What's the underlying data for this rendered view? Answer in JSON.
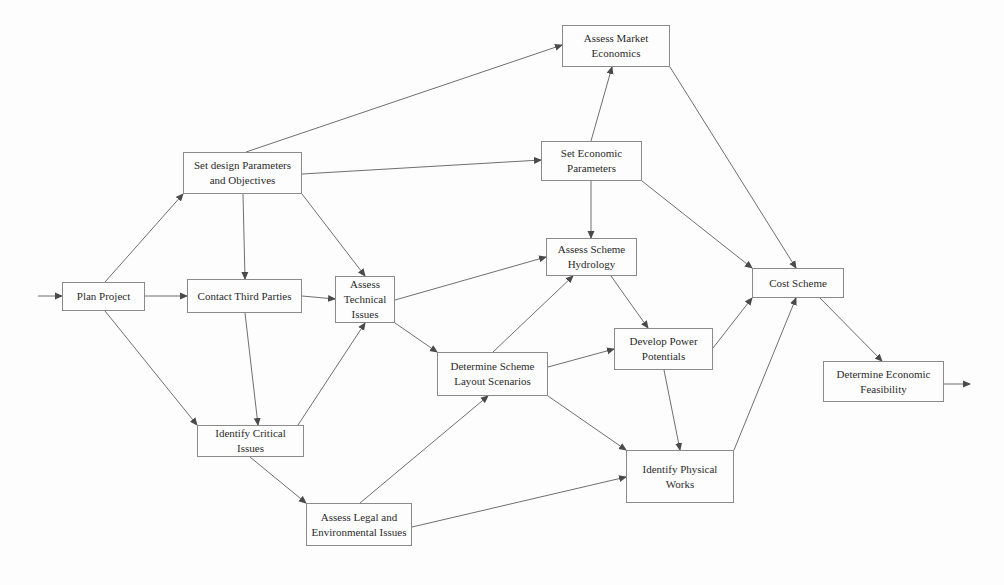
{
  "diagram": {
    "type": "process flow network",
    "nodes": [
      {
        "id": "plan_project",
        "label": "Plan Project",
        "x": 62,
        "y": 282,
        "w": 83,
        "h": 29
      },
      {
        "id": "contact_third_parties",
        "label": "Contact Third Parties",
        "x": 187,
        "y": 279,
        "w": 115,
        "h": 34
      },
      {
        "id": "set_design_parameters",
        "label": "Set design Parameters and Objectives",
        "x": 183,
        "y": 152,
        "w": 119,
        "h": 42
      },
      {
        "id": "assess_market_economics",
        "label": "Assess Market Economics",
        "x": 562,
        "y": 25,
        "w": 108,
        "h": 42
      },
      {
        "id": "set_economic_parameters",
        "label": "Set Economic Parameters",
        "x": 541,
        "y": 141,
        "w": 101,
        "h": 40
      },
      {
        "id": "assess_technical_issues",
        "label": "Assess Technical Issues",
        "x": 335,
        "y": 276,
        "w": 60,
        "h": 47
      },
      {
        "id": "assess_scheme_hydrology",
        "label": "Assess Scheme Hydrology",
        "x": 546,
        "y": 238,
        "w": 91,
        "h": 38
      },
      {
        "id": "determine_layout_scenarios",
        "label": "Determine Scheme Layout Scenarios",
        "x": 437,
        "y": 352,
        "w": 111,
        "h": 44
      },
      {
        "id": "develop_power_potentials",
        "label": "Develop Power Potentials",
        "x": 614,
        "y": 328,
        "w": 99,
        "h": 42
      },
      {
        "id": "cost_scheme",
        "label": "Cost Scheme",
        "x": 752,
        "y": 268,
        "w": 92,
        "h": 30
      },
      {
        "id": "determine_economic_feasibility",
        "label": "Determine Economic Feasibility",
        "x": 823,
        "y": 361,
        "w": 121,
        "h": 41
      },
      {
        "id": "identify_critical_issues",
        "label": "Identify Critical Issues",
        "x": 197,
        "y": 425,
        "w": 107,
        "h": 32
      },
      {
        "id": "identify_physical_works",
        "label": "Identify Physical Works",
        "x": 626,
        "y": 450,
        "w": 108,
        "h": 53
      },
      {
        "id": "assess_legal_environmental",
        "label": "Assess Legal and Environmental Issues",
        "x": 306,
        "y": 503,
        "w": 106,
        "h": 43
      }
    ],
    "edges": [
      {
        "from": "entry",
        "to": "plan_project",
        "x1": 38,
        "y1": 296,
        "x2": 62,
        "y2": 296
      },
      {
        "from": "plan_project",
        "to": "set_design_parameters",
        "x1": 105,
        "y1": 282,
        "x2": 183,
        "y2": 194
      },
      {
        "from": "plan_project",
        "to": "contact_third_parties",
        "x1": 145,
        "y1": 296,
        "x2": 187,
        "y2": 296
      },
      {
        "from": "plan_project",
        "to": "identify_critical_issues",
        "x1": 105,
        "y1": 311,
        "x2": 197,
        "y2": 425
      },
      {
        "from": "set_design_parameters",
        "to": "assess_market_economics",
        "x1": 246,
        "y1": 152,
        "x2": 562,
        "y2": 45
      },
      {
        "from": "set_design_parameters",
        "to": "set_economic_parameters",
        "x1": 302,
        "y1": 174,
        "x2": 541,
        "y2": 160
      },
      {
        "from": "set_design_parameters",
        "to": "contact_third_parties",
        "x1": 243,
        "y1": 194,
        "x2": 245,
        "y2": 279
      },
      {
        "from": "set_design_parameters",
        "to": "assess_technical_issues",
        "x1": 302,
        "y1": 194,
        "x2": 365,
        "y2": 276
      },
      {
        "from": "contact_third_parties",
        "to": "assess_technical_issues",
        "x1": 302,
        "y1": 296,
        "x2": 335,
        "y2": 299
      },
      {
        "from": "contact_third_parties",
        "to": "identify_critical_issues",
        "x1": 245,
        "y1": 313,
        "x2": 258,
        "y2": 425
      },
      {
        "from": "identify_critical_issues",
        "to": "assess_technical_issues",
        "x1": 298,
        "y1": 425,
        "x2": 365,
        "y2": 323
      },
      {
        "from": "identify_critical_issues",
        "to": "assess_legal_environmental",
        "x1": 250,
        "y1": 457,
        "x2": 306,
        "y2": 503
      },
      {
        "from": "assess_technical_issues",
        "to": "assess_scheme_hydrology",
        "x1": 395,
        "y1": 300,
        "x2": 546,
        "y2": 257
      },
      {
        "from": "assess_technical_issues",
        "to": "determine_layout_scenarios",
        "x1": 395,
        "y1": 323,
        "x2": 437,
        "y2": 352
      },
      {
        "from": "assess_legal_environmental",
        "to": "determine_layout_scenarios",
        "x1": 360,
        "y1": 503,
        "x2": 488,
        "y2": 396
      },
      {
        "from": "assess_legal_environmental",
        "to": "identify_physical_works",
        "x1": 412,
        "y1": 527,
        "x2": 626,
        "y2": 477
      },
      {
        "from": "set_economic_parameters",
        "to": "assess_market_economics",
        "x1": 591,
        "y1": 141,
        "x2": 612,
        "y2": 67
      },
      {
        "from": "set_economic_parameters",
        "to": "assess_scheme_hydrology",
        "x1": 591,
        "y1": 181,
        "x2": 591,
        "y2": 238
      },
      {
        "from": "set_economic_parameters",
        "to": "cost_scheme",
        "x1": 642,
        "y1": 181,
        "x2": 752,
        "y2": 268
      },
      {
        "from": "assess_market_economics",
        "to": "cost_scheme",
        "x1": 670,
        "y1": 67,
        "x2": 796,
        "y2": 268
      },
      {
        "from": "determine_layout_scenarios",
        "to": "assess_scheme_hydrology",
        "x1": 493,
        "y1": 352,
        "x2": 573,
        "y2": 276
      },
      {
        "from": "determine_layout_scenarios",
        "to": "develop_power_potentials",
        "x1": 548,
        "y1": 367,
        "x2": 614,
        "y2": 349
      },
      {
        "from": "determine_layout_scenarios",
        "to": "identify_physical_works",
        "x1": 548,
        "y1": 396,
        "x2": 626,
        "y2": 450
      },
      {
        "from": "assess_scheme_hydrology",
        "to": "develop_power_potentials",
        "x1": 611,
        "y1": 276,
        "x2": 648,
        "y2": 328
      },
      {
        "from": "develop_power_potentials",
        "to": "cost_scheme",
        "x1": 713,
        "y1": 348,
        "x2": 752,
        "y2": 298
      },
      {
        "from": "develop_power_potentials",
        "to": "identify_physical_works",
        "x1": 664,
        "y1": 370,
        "x2": 680,
        "y2": 450
      },
      {
        "from": "identify_physical_works",
        "to": "cost_scheme",
        "x1": 734,
        "y1": 450,
        "x2": 796,
        "y2": 298
      },
      {
        "from": "cost_scheme",
        "to": "determine_economic_feasibility",
        "x1": 820,
        "y1": 298,
        "x2": 882,
        "y2": 361
      },
      {
        "from": "determine_economic_feasibility",
        "to": "exit",
        "x1": 944,
        "y1": 384,
        "x2": 970,
        "y2": 384
      }
    ]
  },
  "colors": {
    "line": "#6f6f6f",
    "border": "#8a8a8a",
    "text": "#2b2b2b",
    "background": "#fdfdfd"
  }
}
